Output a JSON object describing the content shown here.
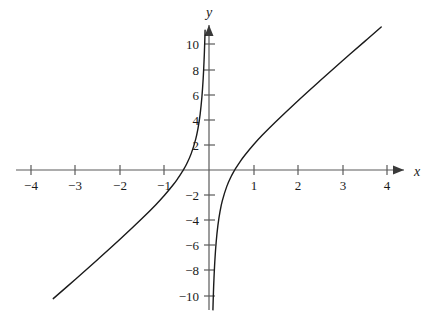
{
  "chart_data": {
    "type": "line",
    "title": "",
    "subtitle": "",
    "xlabel": "x",
    "ylabel": "y",
    "xlim": [
      -4.6,
      4.3
    ],
    "ylim": [
      -10.9,
      11.2
    ],
    "grid": false,
    "legend": null,
    "function_expression": "y = 3x - 1/x",
    "vertical_asymptote": 0,
    "x_ticks": [
      -4,
      -3,
      -2,
      -1,
      1,
      2,
      3,
      4
    ],
    "x_tick_labels": [
      "−4",
      "−3",
      "−2",
      "−1",
      "1",
      "2",
      "3",
      "4"
    ],
    "y_ticks": [
      10,
      8,
      6,
      4,
      2,
      -2,
      -4,
      -6,
      -8,
      -10
    ],
    "y_tick_labels": [
      "10",
      "8",
      "6",
      "4",
      "2",
      "−2",
      "−4",
      "−6",
      "−8",
      "−10"
    ],
    "x_intercepts": [
      -0.577,
      0.577
    ],
    "series": [
      {
        "name": "left-branch",
        "domain": [
          -4.3,
          -0.09
        ],
        "points": [
          [
            -4.3,
            -12.67
          ],
          [
            -4.0,
            -11.75
          ],
          [
            -3.5,
            -10.21
          ],
          [
            -3.0,
            -8.67
          ],
          [
            -2.5,
            -7.1
          ],
          [
            -2.0,
            -5.5
          ],
          [
            -1.5,
            -3.83
          ],
          [
            -1.2,
            -2.77
          ],
          [
            -1.0,
            -2.0
          ],
          [
            -0.8,
            -1.15
          ],
          [
            -0.7,
            -0.67
          ],
          [
            -0.6,
            -0.13
          ],
          [
            -0.577,
            0.0
          ],
          [
            -0.5,
            0.5
          ],
          [
            -0.4,
            1.3
          ],
          [
            -0.3,
            2.43
          ],
          [
            -0.25,
            3.25
          ],
          [
            -0.2,
            4.4
          ],
          [
            -0.16,
            5.77
          ],
          [
            -0.13,
            7.3
          ],
          [
            -0.11,
            8.76
          ],
          [
            -0.1,
            9.7
          ],
          [
            -0.094,
            10.36
          ],
          [
            -0.088,
            11.1
          ]
        ]
      },
      {
        "name": "right-branch",
        "domain": [
          0.088,
          3.87
        ],
        "points": [
          [
            0.088,
            -11.1
          ],
          [
            0.094,
            -10.36
          ],
          [
            0.1,
            -9.7
          ],
          [
            0.11,
            -8.76
          ],
          [
            0.13,
            -7.3
          ],
          [
            0.16,
            -5.77
          ],
          [
            0.2,
            -4.4
          ],
          [
            0.25,
            -3.25
          ],
          [
            0.3,
            -2.43
          ],
          [
            0.4,
            -1.3
          ],
          [
            0.5,
            -0.5
          ],
          [
            0.577,
            0.0
          ],
          [
            0.6,
            0.13
          ],
          [
            0.7,
            0.67
          ],
          [
            0.8,
            1.15
          ],
          [
            1.0,
            2.0
          ],
          [
            1.2,
            2.77
          ],
          [
            1.5,
            3.83
          ],
          [
            2.0,
            5.5
          ],
          [
            2.5,
            7.1
          ],
          [
            3.0,
            8.67
          ],
          [
            3.5,
            10.21
          ],
          [
            3.87,
            11.35
          ]
        ]
      }
    ]
  },
  "axes": {
    "x_axis_label": "x",
    "y_axis_label": "y",
    "x_arrow": "arrow-right",
    "y_arrow": "arrow-up",
    "axis_color": "#5a5a5a",
    "curve_color": "#1a1a1a",
    "background_color": "#ffffff"
  }
}
